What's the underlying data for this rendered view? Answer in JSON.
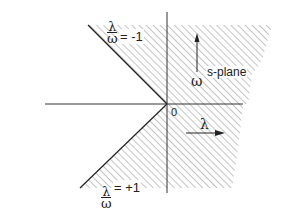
{
  "diagram": {
    "title": "s-plane",
    "plane_label": "s-plane",
    "origin_label": "0",
    "axes": {
      "horizontal": {
        "symbol": "λ",
        "name": "lambda",
        "direction": "right"
      },
      "vertical": {
        "symbol": "ω",
        "name": "omega",
        "direction": "up"
      }
    },
    "boundaries": [
      {
        "label_num": "λ",
        "label_den": "ω",
        "eq": "= -1",
        "position": "upper-left"
      },
      {
        "label_num": "λ",
        "label_den": "ω",
        "eq": "= +1",
        "position": "lower-left"
      }
    ],
    "shaded_region": "right half-plane plus wedge between lines λ/ω = -1 and λ/ω = +1 (hatched)",
    "colors": {
      "ink": "#222222",
      "hatch": "#888888",
      "background": "#ffffff"
    }
  }
}
